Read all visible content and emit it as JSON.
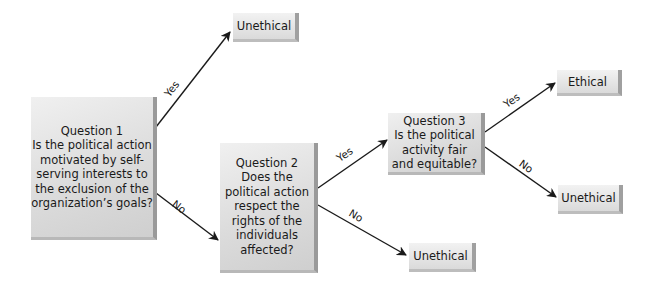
{
  "diagram": {
    "type": "decision-tree",
    "nodes": {
      "q1": {
        "title": "Question 1",
        "lines": [
          "Is the political action",
          "motivated by self-",
          "serving interests to",
          "the exclusion of the",
          "organization’s goals?"
        ]
      },
      "q2": {
        "title": "Question 2",
        "lines": [
          "Does the",
          "political action",
          "respect the",
          "rights of the",
          "individuals",
          "affected?"
        ]
      },
      "q3": {
        "title": "Question 3",
        "lines": [
          "Is the political",
          "activity fair",
          "and equitable?"
        ]
      },
      "out_q1_yes": {
        "label": "Unethical"
      },
      "out_q2_no": {
        "label": "Unethical"
      },
      "out_q3_yes": {
        "label": "Ethical"
      },
      "out_q3_no": {
        "label": "Unethical"
      }
    },
    "edges": [
      {
        "from": "q1",
        "to": "out_q1_yes",
        "label": "Yes"
      },
      {
        "from": "q1",
        "to": "q2",
        "label": "No"
      },
      {
        "from": "q2",
        "to": "q3",
        "label": "Yes"
      },
      {
        "from": "q2",
        "to": "out_q2_no",
        "label": "No"
      },
      {
        "from": "q3",
        "to": "out_q3_yes",
        "label": "Yes"
      },
      {
        "from": "q3",
        "to": "out_q3_no",
        "label": "No"
      }
    ]
  }
}
